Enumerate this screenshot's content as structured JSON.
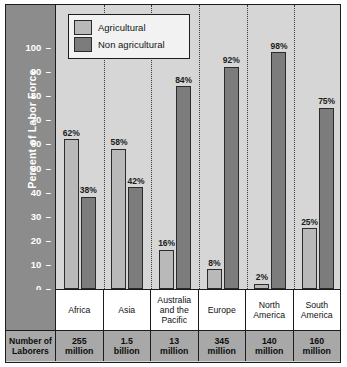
{
  "chart_data": {
    "type": "bar",
    "title": "",
    "xlabel": "",
    "ylabel": "Percent of Labor Force",
    "ylim": [
      0,
      100
    ],
    "yticks": [
      0,
      10,
      20,
      30,
      40,
      50,
      60,
      70,
      80,
      90,
      100
    ],
    "grid": false,
    "legend_position": "top-left",
    "categories": [
      "Africa",
      "Asia",
      "Australia and the Pacific",
      "Europe",
      "North America",
      "South America"
    ],
    "series": [
      {
        "name": "Agricultural",
        "color": "#b9b9b9",
        "values": [
          62,
          58,
          16,
          8,
          2,
          25
        ],
        "labels": [
          "62%",
          "58%",
          "16%",
          "8%",
          "2%",
          "25%"
        ]
      },
      {
        "name": "Non agricultural",
        "color": "#7c7c7c",
        "values": [
          38,
          42,
          84,
          92,
          98,
          75
        ],
        "labels": [
          "38%",
          "42%",
          "84%",
          "92%",
          "98%",
          "75%"
        ]
      }
    ],
    "annotation_table": {
      "row_header": "Number of Laborers",
      "values": [
        "255 million",
        "1.5 billion",
        "13 million",
        "345 million",
        "140 million",
        "160 million"
      ]
    }
  },
  "axis": {
    "title": "Percent of Labor Force",
    "ticks": [
      "100",
      "90",
      "80",
      "70",
      "60",
      "50",
      "40",
      "30",
      "20",
      "10",
      "0"
    ]
  },
  "legend": {
    "items": [
      {
        "label": "Agricultural",
        "swatch": "#b9b9b9"
      },
      {
        "label": "Non agricultural",
        "swatch": "#7c7c7c"
      }
    ]
  },
  "categories": [
    {
      "label": "Africa",
      "line1": "Africa",
      "line2": "",
      "line3": ""
    },
    {
      "label": "Asia",
      "line1": "Asia",
      "line2": "",
      "line3": ""
    },
    {
      "label": "Australia and the Pacific",
      "line1": "Australia",
      "line2": "and the",
      "line3": "Pacific"
    },
    {
      "label": "Europe",
      "line1": "Europe",
      "line2": "",
      "line3": ""
    },
    {
      "label": "North America",
      "line1": "North",
      "line2": "America",
      "line3": ""
    },
    {
      "label": "South America",
      "line1": "South",
      "line2": "America",
      "line3": ""
    }
  ],
  "laborers": {
    "header_line1": "Number of",
    "header_line2": "Laborers",
    "cells": [
      {
        "line1": "255",
        "line2": "million"
      },
      {
        "line1": "1.5",
        "line2": "billion"
      },
      {
        "line1": "13",
        "line2": "million"
      },
      {
        "line1": "345",
        "line2": "million"
      },
      {
        "line1": "140",
        "line2": "million"
      },
      {
        "line1": "160",
        "line2": "million"
      }
    ]
  },
  "colors": {
    "agricultural": "#b9b9b9",
    "non_agricultural": "#7c7c7c",
    "plot_background": "#d6d6d6",
    "axis_band": "#8c8c8c",
    "table_band": "#a8a8a8",
    "border": "#1c1c1c"
  }
}
